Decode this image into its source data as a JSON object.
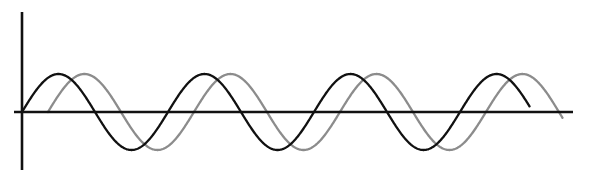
{
  "figure": {
    "title": "",
    "background_color": "#ffffff",
    "width": 589,
    "height": 179
  },
  "axes": {
    "name": "wave-axes",
    "color": "#111111",
    "line_width": 2.6,
    "origin_x": 22,
    "origin_y": 112,
    "y_axis": {
      "x": 22,
      "y_top": 12,
      "y_bottom": 170
    },
    "x_axis": {
      "y": 112,
      "x_left": 22,
      "x_right": 573
    },
    "x_tick_labels": [],
    "y_tick_labels": [],
    "xlabel": "",
    "ylabel": "",
    "grid": false
  },
  "legend": {
    "visible": false,
    "position": "none",
    "entries": []
  },
  "chart_data": {
    "type": "line",
    "title": "",
    "subtitle": "",
    "xlabel": "",
    "ylabel": "",
    "grid": false,
    "legend_position": "none",
    "xlim": [
      0,
      3.78
    ],
    "ylim": [
      -1.25,
      1.25
    ],
    "x_unit": "wavelengths",
    "annotations": [],
    "series": [
      {
        "name": "wave-1",
        "label": "",
        "color": "#111111",
        "line_width": 2.3,
        "amplitude": 1.0,
        "wavelength": 146,
        "phase_degrees": 0,
        "start_x": 22,
        "end_x": 530,
        "cycles": 3.48,
        "peaks_x": [
          62,
          208,
          354
        ],
        "peaks_y": [
          74,
          74,
          74
        ],
        "troughs_x": [
          135,
          281,
          427
        ],
        "troughs_y": [
          150,
          150,
          150
        ],
        "zero_crossings_x": [
          22,
          98,
          171,
          244,
          317,
          390,
          463,
          530
        ]
      },
      {
        "name": "wave-2",
        "label": "",
        "color": "#8c8c8c",
        "line_width": 2.3,
        "amplitude": 1.0,
        "wavelength": 146,
        "phase_degrees": 64,
        "start_x": 48,
        "end_x": 563,
        "cycles": 3.48,
        "peaks_x": [
          88,
          234,
          380
        ],
        "peaks_y": [
          74,
          74,
          74
        ],
        "troughs_x": [
          161,
          307,
          453
        ],
        "troughs_y": [
          150,
          150,
          150
        ],
        "zero_crossings_x": [
          48,
          124,
          197,
          270,
          343,
          416,
          489,
          556
        ]
      }
    ]
  }
}
